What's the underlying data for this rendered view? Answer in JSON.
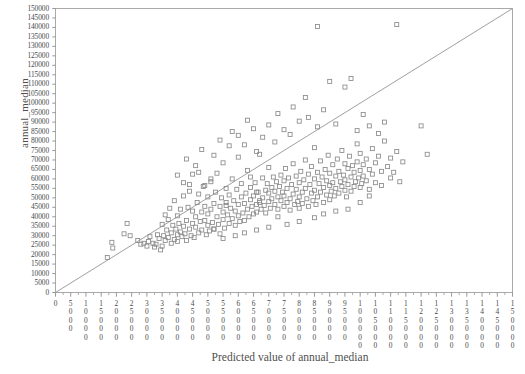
{
  "chart_data": {
    "type": "scatter",
    "title": "",
    "xlabel": "Predicted value of annual_median",
    "ylabel": "annual_median",
    "xlim": [
      0,
      150000
    ],
    "ylim": [
      0,
      150000
    ],
    "xticks": [
      0,
      5000,
      10000,
      15000,
      20000,
      25000,
      30000,
      35000,
      40000,
      45000,
      50000,
      55000,
      60000,
      65000,
      70000,
      75000,
      80000,
      85000,
      90000,
      95000,
      100000,
      105000,
      110000,
      115000,
      120000,
      125000,
      130000,
      135000,
      140000,
      145000,
      150000
    ],
    "yticks": [
      0,
      5000,
      10000,
      15000,
      20000,
      25000,
      30000,
      35000,
      40000,
      45000,
      50000,
      55000,
      60000,
      65000,
      70000,
      75000,
      80000,
      85000,
      90000,
      95000,
      100000,
      105000,
      110000,
      115000,
      120000,
      125000,
      130000,
      135000,
      140000,
      145000,
      150000
    ],
    "xtick_labels": [
      "0",
      "5000",
      "10000",
      "15000",
      "20000",
      "25000",
      "30000",
      "35000",
      "40000",
      "45000",
      "50000",
      "55000",
      "60000",
      "65000",
      "70000",
      "75000",
      "80000",
      "85000",
      "90000",
      "95000",
      "100000",
      "105000",
      "110000",
      "115000",
      "120000",
      "125000",
      "130000",
      "135000",
      "140000",
      "145000",
      "150000"
    ],
    "ytick_labels": [
      "0",
      "5000",
      "10000",
      "15000",
      "20000",
      "25000",
      "30000",
      "35000",
      "40000",
      "45000",
      "50000",
      "55000",
      "60000",
      "65000",
      "70000",
      "75000",
      "80000",
      "85000",
      "90000",
      "95000",
      "100000",
      "105000",
      "110000",
      "115000",
      "120000",
      "125000",
      "130000",
      "135000",
      "140000",
      "145000",
      "150000"
    ],
    "grid": false,
    "legend": null,
    "marker": "open-square",
    "marker_color": "#8a8a8a",
    "reference_line": {
      "name": "identity-line",
      "from": [
        0,
        0
      ],
      "to": [
        150000,
        150000
      ],
      "color": "#9a9a9a"
    },
    "minor_ticks_per_interval": 1,
    "points": [
      [
        17000,
        18500
      ],
      [
        18500,
        26500
      ],
      [
        18800,
        23500
      ],
      [
        22500,
        31000
      ],
      [
        23500,
        36500
      ],
      [
        24500,
        30000
      ],
      [
        27000,
        27500
      ],
      [
        28000,
        25500
      ],
      [
        29000,
        26000
      ],
      [
        30000,
        24500
      ],
      [
        30500,
        27000
      ],
      [
        31000,
        29500
      ],
      [
        32000,
        26000
      ],
      [
        32500,
        24000
      ],
      [
        33000,
        25500
      ],
      [
        33500,
        30500
      ],
      [
        34000,
        28500
      ],
      [
        34500,
        22500
      ],
      [
        35000,
        24500
      ],
      [
        35000,
        36000
      ],
      [
        35500,
        30000
      ],
      [
        36000,
        27500
      ],
      [
        36000,
        41000
      ],
      [
        36500,
        33000
      ],
      [
        37000,
        29000
      ],
      [
        37000,
        38500
      ],
      [
        37500,
        44500
      ],
      [
        38000,
        31500
      ],
      [
        38000,
        26000
      ],
      [
        38500,
        35500
      ],
      [
        39000,
        28000
      ],
      [
        39000,
        48500
      ],
      [
        39500,
        33500
      ],
      [
        40000,
        27000
      ],
      [
        40000,
        30500
      ],
      [
        40000,
        40500
      ],
      [
        40500,
        36500
      ],
      [
        41000,
        32000
      ],
      [
        41000,
        44000
      ],
      [
        41500,
        29500
      ],
      [
        42000,
        35000
      ],
      [
        42000,
        51000
      ],
      [
        42500,
        31000
      ],
      [
        43000,
        38000
      ],
      [
        43000,
        27500
      ],
      [
        43500,
        45000
      ],
      [
        44000,
        33500
      ],
      [
        44000,
        57000
      ],
      [
        44500,
        30000
      ],
      [
        45000,
        36500
      ],
      [
        45000,
        43000
      ],
      [
        45000,
        62500
      ],
      [
        45500,
        29000
      ],
      [
        46000,
        40000
      ],
      [
        46000,
        34500
      ],
      [
        46500,
        47500
      ],
      [
        47000,
        31500
      ],
      [
        47000,
        52000
      ],
      [
        47500,
        37500
      ],
      [
        48000,
        42500
      ],
      [
        48000,
        33000
      ],
      [
        48500,
        56000
      ],
      [
        49000,
        38000
      ],
      [
        49000,
        45500
      ],
      [
        49500,
        30500
      ],
      [
        50000,
        35500
      ],
      [
        50000,
        41500
      ],
      [
        50000,
        50500
      ],
      [
        50500,
        32500
      ],
      [
        51000,
        44000
      ],
      [
        51000,
        58500
      ],
      [
        51500,
        37000
      ],
      [
        52000,
        47000
      ],
      [
        52000,
        33500
      ],
      [
        52500,
        53000
      ],
      [
        53000,
        40000
      ],
      [
        53000,
        63000
      ],
      [
        53500,
        36000
      ],
      [
        54000,
        45500
      ],
      [
        54000,
        31000
      ],
      [
        54500,
        50000
      ],
      [
        55000,
        38500
      ],
      [
        55000,
        42500
      ],
      [
        55000,
        68500
      ],
      [
        55500,
        34000
      ],
      [
        56000,
        47500
      ],
      [
        56000,
        55000
      ],
      [
        56500,
        41000
      ],
      [
        57000,
        36500
      ],
      [
        57000,
        51500
      ],
      [
        57500,
        44500
      ],
      [
        58000,
        39000
      ],
      [
        58000,
        60000
      ],
      [
        58500,
        48500
      ],
      [
        59000,
        35500
      ],
      [
        59000,
        43000
      ],
      [
        59500,
        54500
      ],
      [
        60000,
        40500
      ],
      [
        60000,
        46500
      ],
      [
        60000,
        71500
      ],
      [
        60500,
        37500
      ],
      [
        61000,
        50500
      ],
      [
        61000,
        57500
      ],
      [
        61500,
        42000
      ],
      [
        62000,
        47000
      ],
      [
        62000,
        38000
      ],
      [
        62500,
        52500
      ],
      [
        63000,
        44000
      ],
      [
        63000,
        64500
      ],
      [
        63500,
        40000
      ],
      [
        64000,
        49000
      ],
      [
        64000,
        55500
      ],
      [
        64500,
        45500
      ],
      [
        65000,
        41500
      ],
      [
        65000,
        51000
      ],
      [
        65500,
        58000
      ],
      [
        66000,
        46500
      ],
      [
        66000,
        42500
      ],
      [
        66500,
        53000
      ],
      [
        67000,
        48500
      ],
      [
        67000,
        73000
      ],
      [
        67500,
        44000
      ],
      [
        68000,
        50000
      ],
      [
        68000,
        60500
      ],
      [
        68500,
        46000
      ],
      [
        69000,
        54000
      ],
      [
        69000,
        42000
      ],
      [
        69500,
        57500
      ],
      [
        70000,
        48000
      ],
      [
        70000,
        52500
      ],
      [
        70000,
        66000
      ],
      [
        70500,
        44500
      ],
      [
        71000,
        55500
      ],
      [
        71000,
        49500
      ],
      [
        71500,
        61000
      ],
      [
        72000,
        46500
      ],
      [
        72000,
        53500
      ],
      [
        72500,
        58500
      ],
      [
        73000,
        50500
      ],
      [
        73000,
        44000
      ],
      [
        73500,
        56000
      ],
      [
        74000,
        62000
      ],
      [
        74000,
        48500
      ],
      [
        74500,
        53000
      ],
      [
        75000,
        45500
      ],
      [
        75000,
        59000
      ],
      [
        75000,
        51000
      ],
      [
        75500,
        65500
      ],
      [
        76000,
        47500
      ],
      [
        76000,
        55000
      ],
      [
        76500,
        60500
      ],
      [
        77000,
        49500
      ],
      [
        77000,
        43500
      ],
      [
        77500,
        57000
      ],
      [
        78000,
        52000
      ],
      [
        78000,
        68000
      ],
      [
        78500,
        46500
      ],
      [
        79000,
        54500
      ],
      [
        79000,
        61500
      ],
      [
        79500,
        48000
      ],
      [
        80000,
        50500
      ],
      [
        80000,
        58000
      ],
      [
        80000,
        44500
      ],
      [
        80500,
        64000
      ],
      [
        81000,
        53000
      ],
      [
        81000,
        47000
      ],
      [
        81500,
        59500
      ],
      [
        82000,
        55000
      ],
      [
        82000,
        70000
      ],
      [
        82500,
        49500
      ],
      [
        83000,
        62500
      ],
      [
        83000,
        45500
      ],
      [
        83500,
        57000
      ],
      [
        84000,
        52500
      ],
      [
        84000,
        66500
      ],
      [
        84500,
        48500
      ],
      [
        85000,
        60000
      ],
      [
        85000,
        54000
      ],
      [
        85000,
        76500
      ],
      [
        85500,
        46500
      ],
      [
        86000,
        63500
      ],
      [
        86000,
        50500
      ],
      [
        86500,
        57500
      ],
      [
        87000,
        53000
      ],
      [
        87000,
        69500
      ],
      [
        87500,
        61000
      ],
      [
        88000,
        47500
      ],
      [
        88000,
        55500
      ],
      [
        88500,
        65000
      ],
      [
        89000,
        51500
      ],
      [
        89000,
        59000
      ],
      [
        89500,
        72500
      ],
      [
        90000,
        56500
      ],
      [
        90000,
        49000
      ],
      [
        90000,
        63000
      ],
      [
        90500,
        53500
      ],
      [
        91000,
        67500
      ],
      [
        91000,
        58000
      ],
      [
        91500,
        51000
      ],
      [
        92000,
        61500
      ],
      [
        92000,
        55000
      ],
      [
        92500,
        70500
      ],
      [
        93000,
        64000
      ],
      [
        93000,
        52500
      ],
      [
        93500,
        58500
      ],
      [
        94000,
        56000
      ],
      [
        94000,
        75000
      ],
      [
        94500,
        62000
      ],
      [
        95000,
        54000
      ],
      [
        95000,
        68000
      ],
      [
        95000,
        59500
      ],
      [
        95500,
        50500
      ],
      [
        96000,
        65500
      ],
      [
        96000,
        57000
      ],
      [
        96500,
        72000
      ],
      [
        97000,
        61000
      ],
      [
        97000,
        53500
      ],
      [
        97500,
        67000
      ],
      [
        98000,
        63500
      ],
      [
        98000,
        56000
      ],
      [
        98500,
        58500
      ],
      [
        99000,
        78500
      ],
      [
        99000,
        69000
      ],
      [
        99500,
        60500
      ],
      [
        100000,
        55500
      ],
      [
        100000,
        64500
      ],
      [
        100000,
        73500
      ],
      [
        100500,
        57500
      ],
      [
        101000,
        67500
      ],
      [
        101000,
        61500
      ],
      [
        102000,
        70500
      ],
      [
        102000,
        59000
      ],
      [
        103000,
        65000
      ],
      [
        103000,
        54500
      ],
      [
        104000,
        76000
      ],
      [
        104000,
        62500
      ],
      [
        105000,
        68500
      ],
      [
        105000,
        58000
      ],
      [
        106000,
        72000
      ],
      [
        107000,
        64000
      ],
      [
        107000,
        56500
      ],
      [
        108000,
        80000
      ],
      [
        109000,
        66500
      ],
      [
        110000,
        60500
      ],
      [
        110000,
        71000
      ],
      [
        111000,
        63500
      ],
      [
        112000,
        74500
      ],
      [
        113000,
        58500
      ],
      [
        114000,
        69000
      ],
      [
        40000,
        62000
      ],
      [
        43000,
        70500
      ],
      [
        46000,
        67000
      ],
      [
        48000,
        75500
      ],
      [
        52000,
        72500
      ],
      [
        54000,
        80500
      ],
      [
        57000,
        77500
      ],
      [
        58000,
        85000
      ],
      [
        60000,
        83000
      ],
      [
        62000,
        78000
      ],
      [
        63000,
        91000
      ],
      [
        65000,
        86500
      ],
      [
        66000,
        74500
      ],
      [
        68000,
        82000
      ],
      [
        70000,
        88500
      ],
      [
        72000,
        79500
      ],
      [
        73000,
        94500
      ],
      [
        75000,
        86000
      ],
      [
        77000,
        83500
      ],
      [
        78000,
        98000
      ],
      [
        80000,
        90500
      ],
      [
        82000,
        103000
      ],
      [
        83000,
        92500
      ],
      [
        86000,
        87500
      ],
      [
        88000,
        96500
      ],
      [
        90000,
        111500
      ],
      [
        92000,
        89000
      ],
      [
        95000,
        108500
      ],
      [
        97000,
        113000
      ],
      [
        99000,
        85500
      ],
      [
        101000,
        94000
      ],
      [
        103000,
        88000
      ],
      [
        106000,
        84000
      ],
      [
        108000,
        90000
      ],
      [
        86000,
        140500
      ],
      [
        112000,
        141500
      ],
      [
        66000,
        53000
      ],
      [
        67000,
        47500
      ],
      [
        64000,
        61000
      ],
      [
        56000,
        46000
      ],
      [
        51000,
        60000
      ],
      [
        49000,
        56500
      ],
      [
        47000,
        63500
      ],
      [
        44000,
        53500
      ],
      [
        42000,
        58000
      ],
      [
        100000,
        47500
      ],
      [
        103000,
        51000
      ],
      [
        96000,
        44000
      ],
      [
        92000,
        43000
      ],
      [
        88000,
        41500
      ],
      [
        85000,
        39500
      ],
      [
        80000,
        37500
      ],
      [
        76000,
        36000
      ],
      [
        73000,
        40000
      ],
      [
        70000,
        34500
      ],
      [
        66000,
        33000
      ],
      [
        62000,
        31500
      ],
      [
        59000,
        30000
      ],
      [
        55000,
        28500
      ],
      [
        52000,
        33500
      ],
      [
        120000,
        88000
      ],
      [
        122000,
        73000
      ]
    ]
  }
}
